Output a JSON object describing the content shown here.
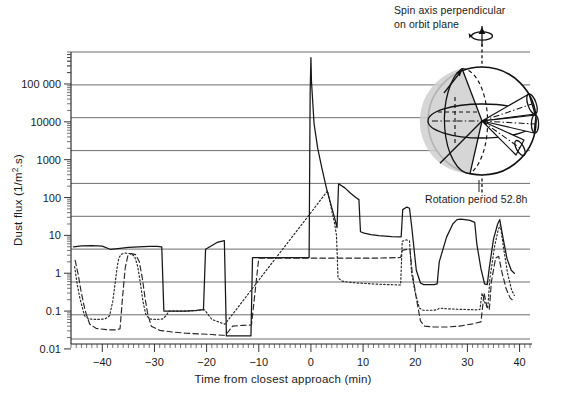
{
  "chart_data": {
    "type": "line",
    "title": "",
    "xlabel": "Time from closest approach (min)",
    "ylabel": "Dust flux (1/m².s)",
    "xlim": [
      -46,
      42
    ],
    "ylim": [
      0.0135,
      700000
    ],
    "yscale": "log",
    "xscale": "linear",
    "grid": true,
    "legend_position": "none",
    "xticks": [
      -40,
      -30,
      -20,
      -10,
      0,
      10,
      20,
      30,
      40
    ],
    "xtick_labels": [
      "−40",
      "−30",
      "−20",
      "−10",
      "0",
      "10",
      "20",
      "30",
      "40"
    ],
    "yticks": [
      0.01,
      0.1,
      1,
      10,
      100,
      1000,
      10000,
      100000
    ],
    "ytick_labels": [
      "0.01",
      "0.1",
      "1",
      "10",
      "100",
      "1000",
      "10000",
      "100 000"
    ],
    "series": [
      {
        "name": "solid",
        "style": "solid",
        "points": [
          [
            -45.5,
            5.0
          ],
          [
            -44.0,
            5.3
          ],
          [
            -42.0,
            5.4
          ],
          [
            -40.0,
            5.2
          ],
          [
            -38.5,
            4.3
          ],
          [
            -37.0,
            4.5
          ],
          [
            -35.0,
            4.8
          ],
          [
            -33.0,
            5.0
          ],
          [
            -31.0,
            5.1
          ],
          [
            -29.5,
            5.1
          ],
          [
            -28.6,
            5.0
          ],
          [
            -28.2,
            0.1
          ],
          [
            -24.0,
            0.1
          ],
          [
            -22.0,
            0.105
          ],
          [
            -20.6,
            0.11
          ],
          [
            -20.2,
            4.3
          ],
          [
            -18.0,
            6.5
          ],
          [
            -16.6,
            7.3
          ],
          [
            -16.2,
            0.022
          ],
          [
            -14.0,
            0.022
          ],
          [
            -11.5,
            0.022
          ],
          [
            -11.2,
            2.6
          ],
          [
            -9.0,
            2.6
          ],
          [
            -5.0,
            2.6
          ],
          [
            -1.5,
            2.6
          ],
          [
            -0.35,
            2.6
          ],
          [
            -0.15,
            60000
          ],
          [
            0.0,
            500000
          ],
          [
            0.1,
            120000
          ],
          [
            0.6,
            9000
          ],
          [
            1.3,
            2000
          ],
          [
            2.1,
            600
          ],
          [
            3.0,
            170
          ],
          [
            3.9,
            60
          ],
          [
            4.6,
            27
          ],
          [
            5.0,
            16
          ],
          [
            5.3,
            230
          ],
          [
            6.5,
            180
          ],
          [
            7.6,
            130
          ],
          [
            8.6,
            100
          ],
          [
            9.2,
            88
          ],
          [
            9.5,
            12.5
          ],
          [
            10.2,
            11.5
          ],
          [
            11.5,
            10.5
          ],
          [
            13.0,
            9.8
          ],
          [
            15.5,
            9.3
          ],
          [
            17.3,
            9.2
          ],
          [
            17.6,
            48
          ],
          [
            18.4,
            56
          ],
          [
            18.9,
            52
          ],
          [
            19.3,
            18
          ],
          [
            20.2,
            1.2
          ],
          [
            21.0,
            0.55
          ],
          [
            21.6,
            0.5
          ],
          [
            23.6,
            0.5
          ],
          [
            24.2,
            0.52
          ],
          [
            24.6,
            2.0
          ],
          [
            26.0,
            9.0
          ],
          [
            27.2,
            20
          ],
          [
            28.0,
            26
          ],
          [
            28.8,
            27
          ],
          [
            30.5,
            25
          ],
          [
            31.4,
            22
          ],
          [
            31.8,
            6.0
          ],
          [
            32.6,
            1.3
          ],
          [
            33.3,
            0.52
          ],
          [
            33.8,
            0.5
          ],
          [
            34.2,
            1.4
          ],
          [
            35.0,
            8.0
          ],
          [
            35.8,
            20
          ],
          [
            36.2,
            26
          ],
          [
            36.8,
            9.0
          ],
          [
            37.6,
            2.4
          ],
          [
            38.4,
            1.2
          ],
          [
            39.0,
            1.0
          ]
        ]
      },
      {
        "name": "dotted",
        "style": "dotted",
        "points": [
          [
            -45.3,
            1.5
          ],
          [
            -44.8,
            0.5
          ],
          [
            -44.3,
            0.22
          ],
          [
            -43.8,
            0.12
          ],
          [
            -43.4,
            0.075
          ],
          [
            -42.6,
            0.062
          ],
          [
            -41.0,
            0.06
          ],
          [
            -39.5,
            0.062
          ],
          [
            -38.6,
            0.075
          ],
          [
            -38.0,
            0.18
          ],
          [
            -37.5,
            0.6
          ],
          [
            -37.1,
            1.6
          ],
          [
            -36.8,
            2.6
          ],
          [
            -36.3,
            3.2
          ],
          [
            -35.6,
            3.4
          ],
          [
            -34.6,
            3.3
          ],
          [
            -33.8,
            2.8
          ],
          [
            -33.2,
            1.5
          ],
          [
            -32.7,
            0.55
          ],
          [
            -32.2,
            0.18
          ],
          [
            -31.7,
            0.085
          ],
          [
            -31.0,
            0.062
          ],
          [
            -29.5,
            0.06
          ],
          [
            -28.4,
            0.062
          ],
          [
            -27.8,
            0.075
          ],
          [
            -27.2,
            0.1
          ],
          [
            -26.0,
            0.1
          ],
          [
            -24.0,
            0.1
          ],
          [
            -22.0,
            0.103
          ],
          [
            -20.8,
            0.108
          ],
          [
            -20.4,
            0.108
          ],
          [
            -19.0,
            0.06
          ],
          [
            -16.5,
            0.045
          ],
          [
            3.2,
            150
          ],
          [
            3.9,
            52
          ],
          [
            4.5,
            22
          ],
          [
            4.9,
            10
          ],
          [
            5.2,
            0.75
          ],
          [
            6.0,
            0.62
          ],
          [
            7.2,
            0.58
          ],
          [
            8.4,
            0.56
          ],
          [
            9.1,
            0.55
          ],
          [
            9.4,
            0.55
          ],
          [
            10.0,
            0.54
          ],
          [
            12.0,
            0.52
          ],
          [
            15.0,
            0.5
          ],
          [
            17.2,
            0.49
          ],
          [
            17.5,
            7.0
          ],
          [
            18.3,
            7.6
          ],
          [
            18.9,
            7.2
          ],
          [
            19.3,
            1.0
          ],
          [
            20.0,
            0.3
          ],
          [
            20.8,
            0.12
          ],
          [
            21.5,
            0.105
          ],
          [
            23.5,
            0.105
          ],
          [
            24.3,
            0.11
          ],
          [
            24.6,
            0.12
          ],
          [
            26.0,
            0.115
          ],
          [
            28.0,
            0.112
          ],
          [
            31.5,
            0.108
          ],
          [
            32.4,
            0.11
          ],
          [
            32.8,
            0.3
          ],
          [
            33.4,
            0.16
          ],
          [
            33.9,
            0.12
          ],
          [
            34.3,
            0.7
          ],
          [
            35.2,
            5.0
          ],
          [
            35.9,
            14
          ],
          [
            36.3,
            19
          ],
          [
            36.9,
            5.0
          ],
          [
            37.7,
            1.0
          ],
          [
            38.5,
            0.35
          ],
          [
            39.0,
            0.26
          ]
        ]
      },
      {
        "name": "dashed",
        "style": "dashed",
        "points": [
          [
            -45.2,
            2.2
          ],
          [
            -44.6,
            0.9
          ],
          [
            -44.1,
            0.35
          ],
          [
            -43.6,
            0.16
          ],
          [
            -43.1,
            0.085
          ],
          [
            -42.4,
            0.045
          ],
          [
            -41.2,
            0.035
          ],
          [
            -39.0,
            0.032
          ],
          [
            -37.5,
            0.032
          ],
          [
            -36.6,
            0.034
          ],
          [
            -36.1,
            0.25
          ],
          [
            -35.6,
            1.4
          ],
          [
            -35.1,
            2.9
          ],
          [
            -34.4,
            3.3
          ],
          [
            -33.6,
            3.1
          ],
          [
            -32.9,
            2.0
          ],
          [
            -32.3,
            0.7
          ],
          [
            -31.8,
            0.22
          ],
          [
            -31.3,
            0.085
          ],
          [
            -30.6,
            0.04
          ],
          [
            -29.0,
            0.031
          ],
          [
            -26.5,
            0.028
          ],
          [
            -24.0,
            0.026
          ],
          [
            -21.5,
            0.025
          ],
          [
            -19.0,
            0.024
          ],
          [
            -17.0,
            0.023
          ],
          [
            -16.4,
            0.023
          ],
          [
            -15.0,
            0.04
          ],
          [
            -13.0,
            0.042
          ],
          [
            -11.4,
            0.043
          ],
          [
            -10.0,
            2.5
          ],
          [
            -6.0,
            2.5
          ],
          [
            -2.0,
            2.5
          ],
          [
            0.0,
            2.5
          ],
          [
            3.0,
            2.5
          ],
          [
            6.0,
            2.5
          ],
          [
            9.0,
            2.5
          ],
          [
            12.0,
            2.5
          ],
          [
            15.0,
            2.55
          ],
          [
            17.2,
            2.6
          ],
          [
            17.5,
            4.0
          ],
          [
            18.4,
            4.3
          ],
          [
            19.0,
            4.1
          ],
          [
            19.4,
            1.1
          ],
          [
            20.2,
            0.22
          ],
          [
            21.0,
            0.055
          ],
          [
            21.8,
            0.04
          ],
          [
            23.5,
            0.038
          ],
          [
            26.0,
            0.038
          ],
          [
            28.5,
            0.04
          ],
          [
            31.0,
            0.046
          ],
          [
            32.6,
            0.052
          ],
          [
            33.2,
            0.3
          ],
          [
            33.8,
            0.12
          ],
          [
            34.2,
            0.11
          ],
          [
            34.6,
            0.6
          ],
          [
            35.4,
            2.5
          ],
          [
            36.0,
            2.8
          ],
          [
            36.6,
            1.1
          ],
          [
            37.4,
            0.4
          ],
          [
            38.2,
            0.22
          ],
          [
            39.0,
            0.18
          ]
        ]
      }
    ],
    "annotations": [
      {
        "id": "spin-axis",
        "text_lines": [
          "Spin axis perpendicular",
          "on orbit plane"
        ],
        "position": "top-right"
      },
      {
        "id": "rotation-period",
        "text": "Rotation period 52.8h",
        "position": "right-middle"
      }
    ],
    "inset": {
      "id": "nucleus-globe",
      "description": "shaded rotating nucleus sphere with dust jet cones",
      "jet_count": 3
    }
  },
  "axes": {
    "xlabel": "Time from closest approach (min)",
    "ylabel": "Dust flux (1/m².s)",
    "x_tick_labels": [
      "−40",
      "−30",
      "−20",
      "−10",
      "0",
      "10",
      "20",
      "30",
      "40"
    ],
    "y_tick_labels": [
      "0.01",
      "0.1",
      "1",
      "10",
      "100",
      "1000",
      "10000",
      "100 000"
    ]
  },
  "annotations": {
    "spin_axis_line1": "Spin axis perpendicular",
    "spin_axis_line2": "on orbit plane",
    "rotation_period": "Rotation period 52.8h"
  },
  "colors": {
    "ink": "#161616",
    "grid": "#5d5d5d",
    "shade": "#cfcfcf",
    "background": "#ffffff"
  }
}
